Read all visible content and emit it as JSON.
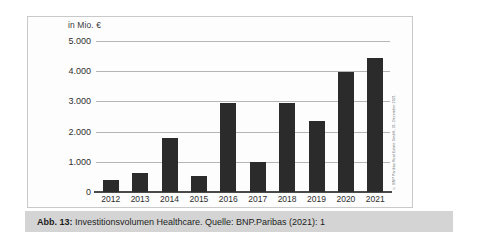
{
  "caption": {
    "prefix": "Abb. 13:",
    "rest": " Investitionsvolumen Healthcare. Quelle: BNP.Paribas (2021): 1"
  },
  "credit": "© BNP Paribas Real Estate GmbH, 31. Dezember 2021",
  "chart_data": {
    "type": "bar",
    "title": "",
    "unit_label": "in Mio. €",
    "xlabel": "",
    "ylabel": "in Mio. €",
    "categories": [
      "2012",
      "2013",
      "2014",
      "2015",
      "2016",
      "2017",
      "2018",
      "2019",
      "2020",
      "2021"
    ],
    "values": [
      400,
      620,
      1790,
      530,
      2960,
      980,
      2960,
      2350,
      3970,
      4430
    ],
    "ylim": [
      0,
      5000
    ],
    "yticks": [
      0,
      1000,
      2000,
      3000,
      4000,
      5000
    ],
    "ytick_labels": [
      "0",
      "1.000",
      "2.000",
      "3.000",
      "4.000",
      "5.000"
    ],
    "grid": true,
    "legend": false,
    "bar_color": "#2b2b2b",
    "grid_color": "#b5b5b5"
  }
}
